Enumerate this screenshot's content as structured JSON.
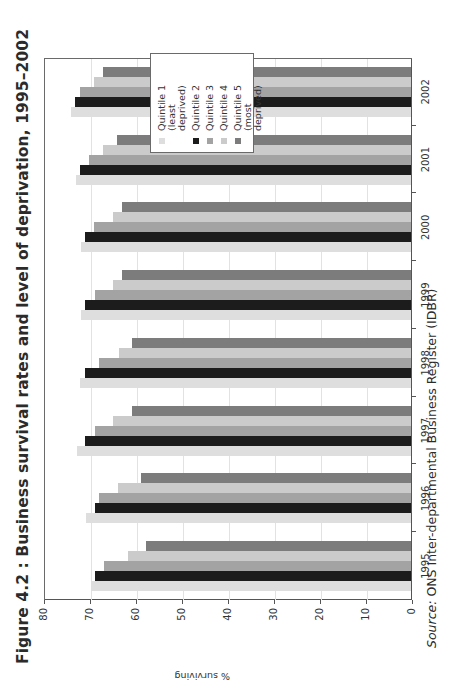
{
  "figure": {
    "title": "Figure 4.2 : Business survival rates and level of deprivation, 1995–2002",
    "source_label": "Source:",
    "source_text": "ONS Inter-departmental Business Register (IDBR)"
  },
  "colors": {
    "quintile_1": "#dedede",
    "quintile_2": "#1c1c1c",
    "quintile_3": "#a3a3a3",
    "quintile_4": "#cbcbcb",
    "quintile_5": "#7c7c7c"
  },
  "chart_data": {
    "type": "bar",
    "title": "Figure 4.2 : Business survival rates and level of deprivation, 1995–2002",
    "xlabel": "",
    "ylabel": "% surviving",
    "ylim": [
      0,
      80
    ],
    "yticks": [
      0,
      10,
      20,
      30,
      40,
      50,
      60,
      70,
      80
    ],
    "grid": true,
    "legend_position": "upper right",
    "categories": [
      "1995",
      "1996",
      "1997",
      "1998",
      "1999",
      "2000",
      "2001",
      "2002"
    ],
    "series": [
      {
        "name": "Quintile 1 (least deprived)",
        "color": "#dedede",
        "values": [
          69.6,
          70.7,
          72.6,
          72.0,
          71.7,
          71.7,
          72.8,
          73.9
        ]
      },
      {
        "name": "Quintile 2",
        "color": "#1c1c1c",
        "values": [
          68.7,
          68.7,
          70.9,
          70.9,
          70.9,
          70.9,
          72.0,
          73.0
        ]
      },
      {
        "name": "Quintile 3",
        "color": "#a3a3a3",
        "values": [
          66.7,
          67.8,
          68.7,
          67.8,
          68.7,
          68.9,
          70.0,
          72.0
        ]
      },
      {
        "name": "Quintile 4",
        "color": "#cbcbcb",
        "values": [
          61.5,
          63.7,
          64.8,
          63.5,
          64.8,
          64.8,
          67.0,
          68.9
        ]
      },
      {
        "name": "Quintile 5 (most deprived)",
        "color": "#7c7c7c",
        "values": [
          57.6,
          58.7,
          60.7,
          60.7,
          62.8,
          62.8,
          63.9,
          67.0
        ]
      }
    ]
  },
  "legend": {
    "items": [
      {
        "label": "Quintile 1 (least deprived)"
      },
      {
        "label": "Quintile 2"
      },
      {
        "label": "Quintile 3"
      },
      {
        "label": "Quintile 4"
      },
      {
        "label": "Quintile 5 (most deprived)"
      }
    ]
  }
}
